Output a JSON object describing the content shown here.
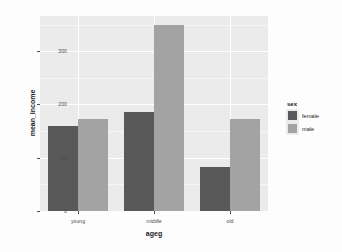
{
  "chart_data": {
    "type": "bar",
    "title": "",
    "xlabel": "ageg",
    "ylabel": "mean_income",
    "categories": [
      "young",
      "middle",
      "old"
    ],
    "series": [
      {
        "name": "female",
        "color": "#595959",
        "values": [
          160,
          185,
          83
        ]
      },
      {
        "name": "male",
        "color": "#a3a3a3",
        "values": [
          172,
          350,
          173
        ]
      }
    ],
    "legend": {
      "title": "sex",
      "position": "right"
    },
    "yticks": [
      0,
      100,
      200,
      300
    ],
    "ytick_labels": [
      "0",
      "100",
      "200",
      "300"
    ],
    "ylim": [
      0,
      366
    ],
    "grid": true,
    "panel_background": "#ebebeb",
    "grid_color": "#ffffff"
  }
}
